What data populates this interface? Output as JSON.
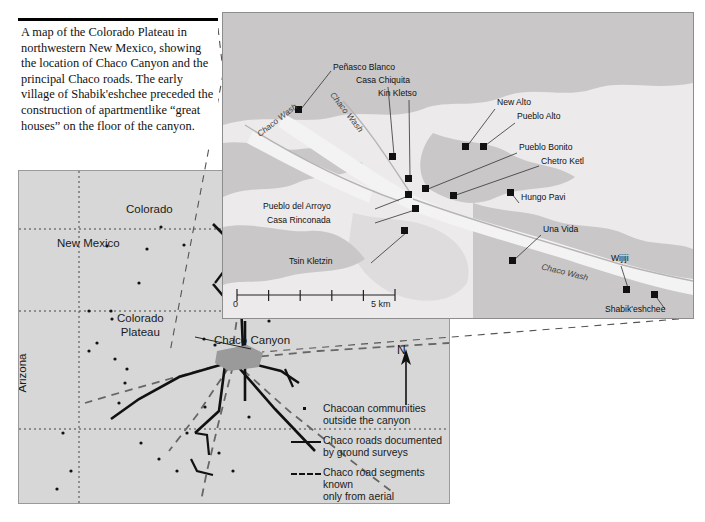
{
  "caption": {
    "text": "A map of the Colorado Plateau in northwestern New Mexico, showing the location of Chaco Canyon and the principal Chaco roads. The early village of Shabik'eshchee preceded the construction of apartmentlike “great houses” on the floor of the canyon."
  },
  "overview_map": {
    "labels": {
      "colorado": "Colorado",
      "new_mexico": "New Mexico",
      "colorado_plateau_line1": "Colorado",
      "colorado_plateau_line2": "Plateau",
      "arizona": "Arizona",
      "chaco_canyon": "Chaco Canyon"
    },
    "north_arrow": {
      "letter": "N"
    },
    "legend": [
      {
        "symbol": "dot",
        "line1": "Chacoan communities",
        "line2": "outside the canyon"
      },
      {
        "symbol": "solid",
        "line1": "Chaco roads documented",
        "line2": "by ground surveys"
      },
      {
        "symbol": "dash",
        "line1": "Chaco road segments known",
        "line2": "only from aerial photographs"
      }
    ],
    "colors": {
      "background": "#d7d7d7",
      "border": "#9a9a9a",
      "road_solid": "#111111",
      "road_dashed": "#555555",
      "state_boundary": "#333333",
      "canyon_marker": "#8d8d8d"
    }
  },
  "detail_map": {
    "sites": [
      {
        "name": "Peñasco Blanco",
        "label_x": 110,
        "label_y": 54,
        "marker_x": 76,
        "marker_y": 97
      },
      {
        "name": "Casa Chiquita",
        "label_x": 133,
        "label_y": 67,
        "marker_x": 170,
        "marker_y": 144
      },
      {
        "name": "Kin Kletso",
        "label_x": 155,
        "label_y": 80,
        "marker_x": 186,
        "marker_y": 166
      },
      {
        "name": "New Alto",
        "label_x": 272,
        "label_y": 89,
        "marker_x": 243,
        "marker_y": 134
      },
      {
        "name": "Pueblo Alto",
        "label_x": 293,
        "label_y": 103,
        "marker_x": 261,
        "marker_y": 134
      },
      {
        "name": "Pueblo Bonito",
        "label_x": 296,
        "label_y": 135,
        "marker_x": 203,
        "marker_y": 176
      },
      {
        "name": "Chetro Ketl",
        "label_x": 318,
        "label_y": 148,
        "marker_x": 231,
        "marker_y": 183
      },
      {
        "name": "Pueblo del Arroyo",
        "label_x": 40,
        "label_y": 193,
        "marker_x": 186,
        "marker_y": 182
      },
      {
        "name": "Casa Rinconada",
        "label_x": 42,
        "label_y": 206,
        "marker_x": 193,
        "marker_y": 196
      },
      {
        "name": "Tsin Kletzin",
        "label_x": 65,
        "label_y": 248,
        "marker_x": 182,
        "marker_y": 218
      },
      {
        "name": "Hungo Pavi",
        "label_x": 298,
        "label_y": 185,
        "marker_x": 288,
        "marker_y": 180
      },
      {
        "name": "Una Vida",
        "label_x": 320,
        "label_y": 216,
        "marker_x": 290,
        "marker_y": 248
      },
      {
        "name": "Wijiji",
        "label_x": 390,
        "label_y": 245,
        "marker_x": 404,
        "marker_y": 277
      },
      {
        "name": "Shabik'eshchee",
        "label_x": 388,
        "label_y": 296,
        "marker_x": 432,
        "marker_y": 282
      }
    ],
    "wash_labels": [
      {
        "text": "Chaco Wash",
        "x": 30,
        "y": 105,
        "rotate": -38
      },
      {
        "text": "Chaco Wash",
        "x": 102,
        "y": 98,
        "rotate": 52
      },
      {
        "text": "Chaco Wash",
        "x": 320,
        "y": 258,
        "rotate": 14
      }
    ],
    "scale": {
      "zero": "0",
      "max": "5 km",
      "divisions": 5
    },
    "colors": {
      "background": "#eceaea",
      "mesa": "#c9c7c7",
      "border": "#8d8d8d",
      "marker": "#111111",
      "leader": "#333333"
    }
  }
}
